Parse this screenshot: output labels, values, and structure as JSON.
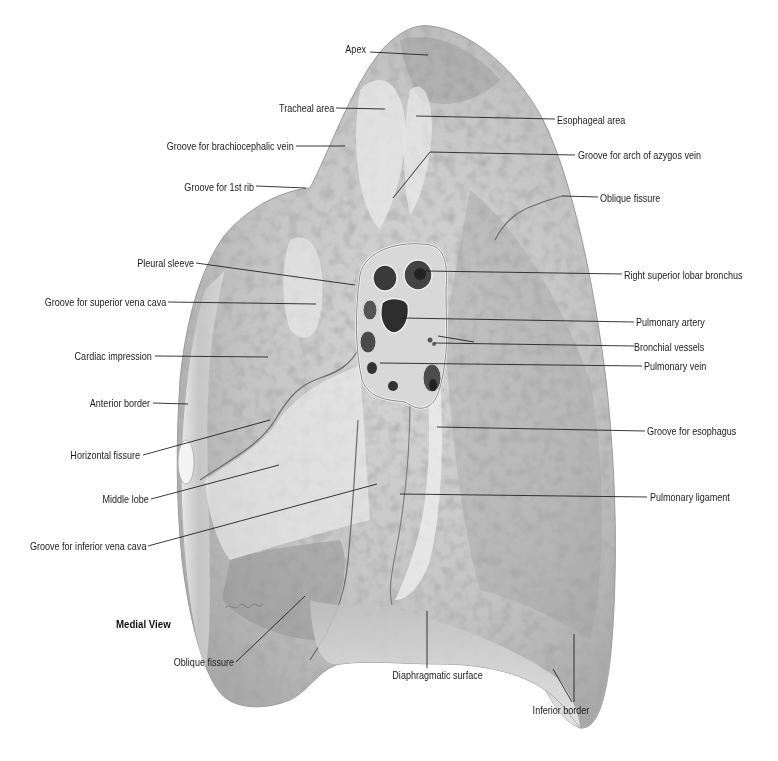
{
  "figure": {
    "view_title": "Medial View",
    "colors": {
      "background": "#ffffff",
      "lung_light": "#e6e6e6",
      "lung_mid": "#bdbdbd",
      "lung_dark": "#8a8a8a",
      "leader_line": "#222222",
      "label_text": "#1a1a1a"
    }
  },
  "labels": {
    "apex": "Apex",
    "tracheal_area": "Tracheal area",
    "esophageal_area": "Esophageal area",
    "groove_brachiocephalic": "Groove for brachiocephalic vein",
    "groove_azygos": "Groove for arch of azygos vein",
    "groove_1st_rib": "Groove for 1st rib",
    "oblique_fissure_upper": "Oblique fissure",
    "pleural_sleeve": "Pleural sleeve",
    "right_superior_lobar_bronchus": "Right superior lobar bronchus",
    "groove_svc": "Groove for superior vena cava",
    "pulmonary_artery": "Pulmonary artery",
    "bronchial_vessels": "Bronchial vessels",
    "cardiac_impression": "Cardiac impression",
    "pulmonary_vein": "Pulmonary vein",
    "anterior_border": "Anterior border",
    "groove_esophagus": "Groove for esophagus",
    "horizontal_fissure": "Horizontal fissure",
    "middle_lobe": "Middle lobe",
    "pulmonary_ligament": "Pulmonary ligament",
    "groove_ivc": "Groove for inferior vena cava",
    "oblique_fissure_lower": "Oblique fissure",
    "diaphragmatic_surface": "Diaphragmatic surface",
    "inferior_border": "Inferior border"
  }
}
